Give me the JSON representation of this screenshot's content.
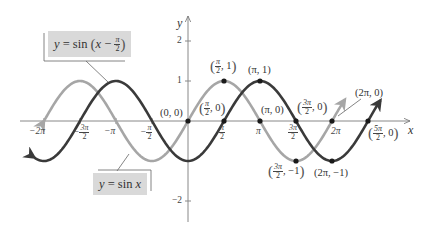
{
  "legend": {
    "shifted_label_parts": [
      "y",
      " = sin ",
      "x",
      " − ",
      "π",
      "2"
    ],
    "shifted_label": "y = sin(x − π/2)",
    "base_label": "y = sin x",
    "base_label_parts": [
      "y",
      " = sin ",
      "x"
    ]
  },
  "axes": {
    "x_label": "x",
    "y_label": "y",
    "y_ticks": [
      {
        "label": "2",
        "value": 2
      },
      {
        "label": "1",
        "value": 1
      },
      {
        "label": "−2",
        "value": -2
      }
    ],
    "x_ticks": [
      {
        "label": "−2π",
        "value": -6.2832
      },
      {
        "label": "−3π/2",
        "num": "3π",
        "den": "2",
        "neg": true,
        "value": -4.7124
      },
      {
        "label": "−π",
        "value": -3.1416
      },
      {
        "label": "−π/2",
        "num": "π",
        "den": "2",
        "neg": true,
        "value": -1.5708
      },
      {
        "label": "π/2",
        "num": "π",
        "den": "2",
        "value": 1.5708
      },
      {
        "label": "π",
        "value": 3.1416
      },
      {
        "label": "3π/2",
        "num": "3π",
        "den": "2",
        "value": 4.7124
      },
      {
        "label": "2π",
        "value": 6.2832
      }
    ]
  },
  "points": [
    {
      "label": "(0, 0)",
      "x": 0,
      "y": 0
    },
    {
      "label": "(π/2, 0)",
      "x": 1.5708,
      "y": 0
    },
    {
      "label": "(π/2, 1)",
      "x": 1.5708,
      "y": 1
    },
    {
      "label": "(π, 1)",
      "x": 3.1416,
      "y": 1
    },
    {
      "label": "(π, 0)",
      "x": 3.1416,
      "y": 0
    },
    {
      "label": "(3π/2, 0)",
      "x": 4.7124,
      "y": 0
    },
    {
      "label": "(2π, 0)",
      "x": 6.2832,
      "y": 0
    },
    {
      "label": "(5π/2, 0)",
      "x": 7.854,
      "y": 0
    },
    {
      "label": "(3π/2, −1)",
      "x": 4.7124,
      "y": -1
    },
    {
      "label": "(2π, −1)",
      "x": 6.2832,
      "y": -1
    }
  ],
  "point_text": {
    "p00": "(0, 0)",
    "pi_1": "(π, 1)",
    "pi_0": "(π, 0)",
    "twopi_0": "(2π, 0)",
    "twopi_m1": "(2π, −1)",
    "half": "π",
    "two": "2",
    "three_pi": "3π",
    "five_pi": "5π",
    "one": ", 1",
    "zero": ", 0",
    "minus_one": ", −1"
  },
  "curves": [
    {
      "name": "y = sin x",
      "color": "#a6a6a6",
      "x_range": [
        -6.28,
        6.85
      ]
    },
    {
      "name": "y = sin(x − π/2)",
      "color": "#3a3a3a",
      "x_range": [
        -6.7,
        8.4
      ]
    }
  ],
  "chart_data": {
    "type": "line",
    "title": "",
    "xlabel": "x",
    "ylabel": "y",
    "xlim": [
      -7.3,
      9.3
    ],
    "ylim": [
      -2.4,
      2.4
    ],
    "grid": false,
    "series": [
      {
        "name": "y = sin x",
        "function": "sin(x)",
        "color": "#a6a6a6",
        "key_points": [
          [
            -6.2832,
            0
          ],
          [
            -4.7124,
            1
          ],
          [
            -3.1416,
            0
          ],
          [
            -1.5708,
            -1
          ],
          [
            0,
            0
          ],
          [
            1.5708,
            1
          ],
          [
            3.1416,
            0
          ],
          [
            4.7124,
            -1
          ],
          [
            6.2832,
            0
          ]
        ]
      },
      {
        "name": "y = sin(x − π/2)",
        "function": "sin(x - pi/2)",
        "color": "#3a3a3a",
        "key_points": [
          [
            -4.7124,
            0
          ],
          [
            -3.1416,
            1
          ],
          [
            -1.5708,
            0
          ],
          [
            0,
            -1
          ],
          [
            1.5708,
            0
          ],
          [
            3.1416,
            1
          ],
          [
            4.7124,
            0
          ],
          [
            6.2832,
            -1
          ],
          [
            7.854,
            0
          ]
        ]
      }
    ],
    "annotations": [
      "(0, 0)",
      "(π/2, 0)",
      "(π/2, 1)",
      "(π, 1)",
      "(π, 0)",
      "(3π/2, 0)",
      "(2π, 0)",
      "(5π/2, 0)",
      "(3π/2, −1)",
      "(2π, −1)"
    ]
  }
}
